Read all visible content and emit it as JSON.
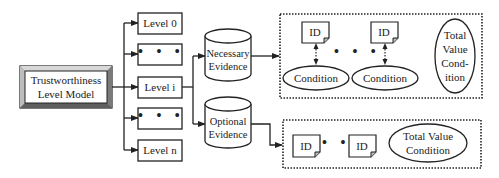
{
  "diagram": {
    "root": {
      "line1": "Trustworthiness",
      "line2": "Level Model"
    },
    "levels": [
      {
        "label": "Level 0"
      },
      {
        "label": "• • •"
      },
      {
        "label": "Level i"
      },
      {
        "label": "• • •"
      },
      {
        "label": "Level n"
      }
    ],
    "evidence": {
      "necessary": {
        "line1": "Necessary",
        "line2": "Evidence"
      },
      "optional": {
        "line1": "Optional",
        "line2": "Evidence"
      }
    },
    "necessary_group": {
      "items": [
        {
          "id_label": "ID",
          "condition_label": "Condition"
        },
        {
          "id_label": "ID",
          "condition_label": "Condition"
        }
      ],
      "ellipsis": "• • •",
      "total": {
        "line1": "Total",
        "line2": "Value",
        "line3": "Cond-",
        "line4": "ition"
      }
    },
    "optional_group": {
      "items": [
        {
          "id_label": "ID"
        },
        {
          "id_label": "ID"
        }
      ],
      "ellipsis": "• •",
      "total": {
        "line1": "Total Value",
        "line2": "Condition"
      }
    },
    "colors": {
      "stroke": "#222222",
      "bevel_light": "#cfcfcf",
      "bevel_dark": "#6a6a6a",
      "background": "#ffffff"
    }
  }
}
